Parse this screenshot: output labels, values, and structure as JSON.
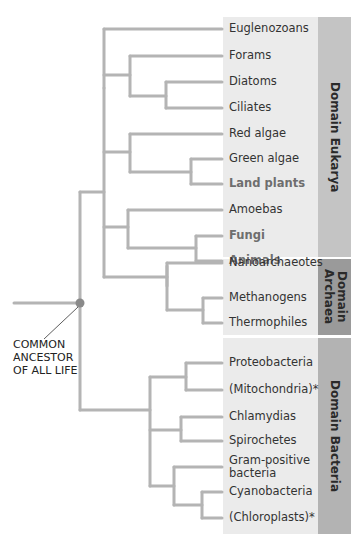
{
  "diagram": {
    "type": "phylogenetic-tree",
    "root_label": [
      "COMMON",
      "ANCESTOR",
      "OF ALL LIFE"
    ],
    "colors": {
      "branch": "#b4b4b4",
      "node_dot": "#8a8a8a",
      "panel_bg": "#ebebeb",
      "eukarya_bar": "#c4c4c4",
      "archaea_bar": "#9a9a9a",
      "bacteria_bar": "#b3b3b3"
    },
    "domains": [
      {
        "name": "Domain Eukarya",
        "label_lines": [
          "Domain Eukarya"
        ],
        "taxa": [
          {
            "label": "Euglenozoans",
            "bold": false
          },
          {
            "label": "Forams",
            "bold": false
          },
          {
            "label": "Diatoms",
            "bold": false
          },
          {
            "label": "Ciliates",
            "bold": false
          },
          {
            "label": "Red algae",
            "bold": false
          },
          {
            "label": "Green algae",
            "bold": false
          },
          {
            "label": "Land plants",
            "bold": true
          },
          {
            "label": "Amoebas",
            "bold": false
          },
          {
            "label": "Fungi",
            "bold": true
          },
          {
            "label": "Animals",
            "bold": true
          }
        ]
      },
      {
        "name": "Domain Archaea",
        "label_lines": [
          "Domain",
          "Archaea"
        ],
        "taxa": [
          {
            "label": "Nanoarchaeotes",
            "bold": false
          },
          {
            "label": "Methanogens",
            "bold": false
          },
          {
            "label": "Thermophiles",
            "bold": false
          }
        ]
      },
      {
        "name": "Domain Bacteria",
        "label_lines": [
          "Domain Bacteria"
        ],
        "taxa": [
          {
            "label": "Proteobacteria",
            "bold": false
          },
          {
            "label": "(Mitochondria)*",
            "bold": false
          },
          {
            "label": "Chlamydias",
            "bold": false
          },
          {
            "label": "Spirochetes",
            "bold": false
          },
          {
            "label": "Gram-positive",
            "label2": "bacteria",
            "bold": false
          },
          {
            "label": "Cyanobacteria",
            "bold": false
          },
          {
            "label": "(Chloroplasts)*",
            "bold": false
          }
        ]
      }
    ]
  }
}
